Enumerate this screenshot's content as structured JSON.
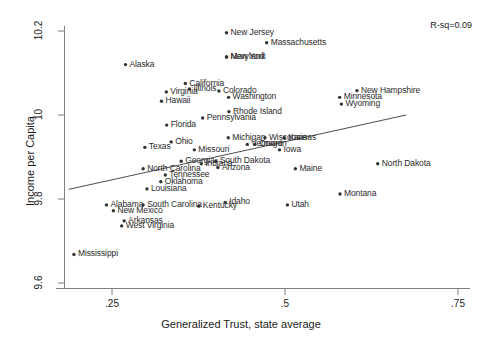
{
  "chart_data": {
    "type": "scatter",
    "title": "",
    "xlabel": "Generalized Trust, state average",
    "ylabel": "Income per Capita",
    "xlim": [
      0.1875,
      0.7875
    ],
    "ylim": [
      9.56,
      10.23
    ],
    "xticks": [
      0.25,
      0.5,
      0.75
    ],
    "xticklabels": [
      ".25",
      ".5",
      ".75"
    ],
    "yticks": [
      9.6,
      9.8,
      10.0,
      10.2
    ],
    "yticklabels": [
      "9.6",
      "9.8",
      "10",
      "10.2"
    ],
    "grid": false,
    "legend": null,
    "annotations": [
      {
        "name": "r-squared",
        "text": "R-sq=0.09",
        "x": 0.73,
        "y": 10.21
      }
    ],
    "fit_line": {
      "type": "linear-fit",
      "x_start": 0.1875,
      "y_start": 9.823,
      "x_end": 0.675,
      "y_end": 10.0
    },
    "marker": {
      "shape": "dot",
      "color": "#333333",
      "size": 2
    },
    "label_color": "#2a2a2a",
    "axis_color": "#666666",
    "points": [
      {
        "label": "New Jersey",
        "x": 0.4155,
        "y": 10.196,
        "dx": 4,
        "dy": -4
      },
      {
        "label": "Massachusetts",
        "x": 0.4735,
        "y": 10.172,
        "dx": 4,
        "dy": -4
      },
      {
        "label": "New York",
        "x": 0.4155,
        "y": 10.138,
        "dx": 4,
        "dy": -4
      },
      {
        "label": "Maryland",
        "x": 0.4155,
        "y": 10.138,
        "dx": 4,
        "dy": -4
      },
      {
        "label": "Alaska",
        "x": 0.2695,
        "y": 10.12,
        "dx": 4,
        "dy": -4
      },
      {
        "label": "California",
        "x": 0.356,
        "y": 10.075,
        "dx": 4,
        "dy": -4
      },
      {
        "label": "Illinois",
        "x": 0.362,
        "y": 10.062,
        "dx": 4,
        "dy": -4
      },
      {
        "label": "Colorado",
        "x": 0.4045,
        "y": 10.057,
        "dx": 4,
        "dy": -4
      },
      {
        "label": "New Hampshire",
        "x": 0.604,
        "y": 10.058,
        "dx": 4,
        "dy": -4
      },
      {
        "label": "Virginia",
        "x": 0.3285,
        "y": 10.055,
        "dx": 4,
        "dy": -4
      },
      {
        "label": "Washington",
        "x": 0.4185,
        "y": 10.042,
        "dx": 4,
        "dy": -4
      },
      {
        "label": "Minnesota",
        "x": 0.579,
        "y": 10.042,
        "dx": 4,
        "dy": -4
      },
      {
        "label": "Hawaii",
        "x": 0.3215,
        "y": 10.033,
        "dx": 4,
        "dy": -4
      },
      {
        "label": "Wyoming",
        "x": 0.5815,
        "y": 10.026,
        "dx": 4,
        "dy": -4
      },
      {
        "label": "Rhode Island",
        "x": 0.419,
        "y": 10.008,
        "dx": 4,
        "dy": -4
      },
      {
        "label": "Pennsylvania",
        "x": 0.381,
        "y": 9.993,
        "dx": 4,
        "dy": -4
      },
      {
        "label": "Florida",
        "x": 0.329,
        "y": 9.976,
        "dx": 4,
        "dy": -4
      },
      {
        "label": "Michigan",
        "x": 0.418,
        "y": 9.946,
        "dx": 4,
        "dy": -4
      },
      {
        "label": "Wisconsin",
        "x": 0.471,
        "y": 9.946,
        "dx": 4,
        "dy": -4
      },
      {
        "label": "Kansas",
        "x": 0.499,
        "y": 9.946,
        "dx": 4,
        "dy": -4
      },
      {
        "label": "Ohio",
        "x": 0.3355,
        "y": 9.936,
        "dx": 4,
        "dy": -4
      },
      {
        "label": "Vermont",
        "x": 0.4455,
        "y": 9.93,
        "dx": 4,
        "dy": -4
      },
      {
        "label": "Oregon",
        "x": 0.4565,
        "y": 9.93,
        "dx": 4,
        "dy": -4
      },
      {
        "label": "Texas",
        "x": 0.2975,
        "y": 9.923,
        "dx": 4,
        "dy": -4
      },
      {
        "label": "Missouri",
        "x": 0.369,
        "y": 9.917,
        "dx": 4,
        "dy": -4
      },
      {
        "label": "Iowa",
        "x": 0.492,
        "y": 9.917,
        "dx": 4,
        "dy": -4
      },
      {
        "label": "Georgia",
        "x": 0.35,
        "y": 9.89,
        "dx": 4,
        "dy": -4
      },
      {
        "label": "Indiana",
        "x": 0.379,
        "y": 9.884,
        "dx": 4,
        "dy": -4
      },
      {
        "label": "South Dakota",
        "x": 0.4,
        "y": 9.89,
        "dx": 4,
        "dy": -4
      },
      {
        "label": "North Dakota",
        "x": 0.634,
        "y": 9.884,
        "dx": 4,
        "dy": -4
      },
      {
        "label": "North Carolina",
        "x": 0.295,
        "y": 9.872,
        "dx": 4,
        "dy": -4
      },
      {
        "label": "Arizona",
        "x": 0.403,
        "y": 9.875,
        "dx": 4,
        "dy": -4
      },
      {
        "label": "Maine",
        "x": 0.515,
        "y": 9.872,
        "dx": 4,
        "dy": -4
      },
      {
        "label": "Tennessee",
        "x": 0.327,
        "y": 9.857,
        "dx": 4,
        "dy": -4
      },
      {
        "label": "Oklahoma",
        "x": 0.3205,
        "y": 9.841,
        "dx": 4,
        "dy": -4
      },
      {
        "label": "Louisiana",
        "x": 0.3005,
        "y": 9.824,
        "dx": 4,
        "dy": -4
      },
      {
        "label": "Montana",
        "x": 0.5795,
        "y": 9.812,
        "dx": 4,
        "dy": -4
      },
      {
        "label": "Alabama",
        "x": 0.242,
        "y": 9.786,
        "dx": 4,
        "dy": -4
      },
      {
        "label": "South Carolina",
        "x": 0.295,
        "y": 9.786,
        "dx": 4,
        "dy": -4
      },
      {
        "label": "Kentucky",
        "x": 0.3755,
        "y": 9.783,
        "dx": 4,
        "dy": -4
      },
      {
        "label": "Idaho",
        "x": 0.4135,
        "y": 9.792,
        "dx": 4,
        "dy": -4
      },
      {
        "label": "Utah",
        "x": 0.5035,
        "y": 9.786,
        "dx": 4,
        "dy": -4
      },
      {
        "label": "New Mexico",
        "x": 0.252,
        "y": 9.772,
        "dx": 4,
        "dy": -4
      },
      {
        "label": "Arkansas",
        "x": 0.2675,
        "y": 9.748,
        "dx": 4,
        "dy": -4
      },
      {
        "label": "West Virginia",
        "x": 0.264,
        "y": 9.736,
        "dx": 4,
        "dy": -4
      },
      {
        "label": "Mississippi",
        "x": 0.195,
        "y": 9.668,
        "dx": 4,
        "dy": -4
      }
    ]
  },
  "axes": {
    "x_title": "Generalized Trust, state average",
    "y_title": "Income per Capita",
    "x_tick_labels": [
      ".25",
      ".5",
      ".75"
    ],
    "y_tick_labels": [
      "10.2",
      "10",
      "9.8",
      "9.6"
    ]
  },
  "annotation": {
    "rsq": "R-sq=0.09"
  }
}
